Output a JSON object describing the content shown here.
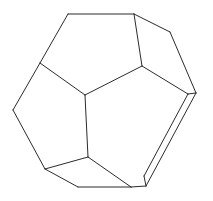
{
  "figure": {
    "kind": "line-drawing",
    "shape_name": "regular dodecahedron",
    "background_color": "#ffffff",
    "stroke_color": "#2b2b2b",
    "stroke_width": 1,
    "canvas": {
      "width": 213,
      "height": 201
    },
    "vertex_count": 20,
    "visible_face_count": 7,
    "vertices": {
      "top_left": [
        68,
        14
      ],
      "top_right": [
        134,
        14
      ],
      "upper_right": [
        170,
        32
      ],
      "left_upper": [
        40,
        63
      ],
      "right_upper": [
        142,
        66
      ],
      "far_right_outer": [
        196,
        93
      ],
      "far_right_inner": [
        188,
        94
      ],
      "left_outer": [
        13,
        110
      ],
      "center": [
        85,
        95
      ],
      "center_lower": [
        88,
        157
      ],
      "lower_left": [
        45,
        169
      ],
      "bottom_left": [
        78,
        187
      ],
      "bottom_right": [
        131,
        187
      ],
      "bottom_right_inner": [
        144,
        176
      ],
      "bottom_right_outer": [
        146,
        186
      ]
    },
    "edges": [
      {
        "name": "top-edge",
        "from": "top_left",
        "to": "top_right"
      },
      {
        "name": "top-right-upper-edge",
        "from": "top_right",
        "to": "upper_right"
      },
      {
        "name": "right-outer-upper-edge",
        "from": "upper_right",
        "to": "far_right_outer"
      },
      {
        "name": "right-sliver-outer-edge",
        "from": "far_right_outer",
        "to": "bottom_right_outer"
      },
      {
        "name": "right-sliver-bottom",
        "from": "bottom_right_outer",
        "to": "bottom_right_inner"
      },
      {
        "name": "right-sliver-inner-edge",
        "from": "bottom_right_inner",
        "to": "far_right_inner"
      },
      {
        "name": "right-sliver-top",
        "from": "far_right_inner",
        "to": "far_right_outer"
      },
      {
        "name": "bottom-right-edge",
        "from": "bottom_right",
        "to": "bottom_right_outer"
      },
      {
        "name": "bottom-edge",
        "from": "bottom_left",
        "to": "bottom_right"
      },
      {
        "name": "bottom-left-edge",
        "from": "lower_left",
        "to": "bottom_left"
      },
      {
        "name": "left-lower-edge",
        "from": "left_outer",
        "to": "lower_left"
      },
      {
        "name": "left-upper-edge",
        "from": "left_upper",
        "to": "left_outer"
      },
      {
        "name": "top-left-edge",
        "from": "top_left",
        "to": "left_upper"
      },
      {
        "name": "inner-left-spoke",
        "from": "left_upper",
        "to": "center"
      },
      {
        "name": "inner-right-spoke",
        "from": "right_upper",
        "to": "center"
      },
      {
        "name": "inner-vertical-spoke",
        "from": "center",
        "to": "center_lower"
      },
      {
        "name": "right-upper-stem",
        "from": "top_right",
        "to": "right_upper"
      },
      {
        "name": "right-upper-to-right",
        "from": "right_upper",
        "to": "far_right_inner"
      },
      {
        "name": "lower-left-spoke",
        "from": "center_lower",
        "to": "lower_left"
      },
      {
        "name": "lower-right-spoke",
        "from": "center_lower",
        "to": "bottom_right"
      }
    ],
    "faces": [
      {
        "name": "face-top",
        "vertices": [
          "top_left",
          "top_right",
          "right_upper",
          "center",
          "left_upper"
        ]
      },
      {
        "name": "face-upper-right",
        "vertices": [
          "top_right",
          "upper_right",
          "far_right_outer",
          "far_right_inner",
          "right_upper"
        ]
      },
      {
        "name": "face-left",
        "vertices": [
          "top_left",
          "left_upper",
          "left_outer",
          "lower_left",
          "center_lower",
          "center"
        ]
      },
      {
        "name": "face-bottom",
        "vertices": [
          "center_lower",
          "lower_left",
          "bottom_left",
          "bottom_right",
          "bottom_right_outer"
        ]
      },
      {
        "name": "face-right-sliver",
        "vertices": [
          "far_right_outer",
          "far_right_inner",
          "bottom_right_inner",
          "bottom_right_outer"
        ]
      },
      {
        "name": "face-lower-right",
        "vertices": [
          "center",
          "right_upper",
          "far_right_inner",
          "bottom_right_inner",
          "bottom_right",
          "center_lower"
        ]
      }
    ]
  }
}
